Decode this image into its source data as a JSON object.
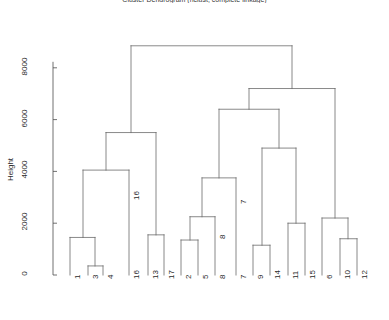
{
  "chart_data": {
    "type": "dendrogram",
    "title": "Cluster Dendrogram (hclust, complete linkage)",
    "xlabel": "",
    "ylabel": "Height",
    "ylim": [
      0,
      9200
    ],
    "yticks": [
      0,
      2000,
      4000,
      6000,
      8000
    ],
    "ytick_labels": [
      "0",
      "2000",
      "4000",
      "6000",
      "8000"
    ],
    "grid": false,
    "legend": null,
    "leaf_order": [
      "1",
      "3",
      "4",
      "16",
      "13",
      "17",
      "2",
      "5",
      "8",
      "7",
      "9",
      "14",
      "11",
      "15",
      "6",
      "10",
      "12"
    ],
    "leaves": [
      {
        "label": "1",
        "x": 70,
        "height": 0
      },
      {
        "label": "3",
        "x": 88,
        "height": 0
      },
      {
        "label": "4",
        "x": 103,
        "height": 0
      },
      {
        "label": "16",
        "x": 129,
        "height": 0
      },
      {
        "label": "13",
        "x": 148,
        "height": 0
      },
      {
        "label": "17",
        "x": 164,
        "height": 0
      },
      {
        "label": "2",
        "x": 181,
        "height": 0
      },
      {
        "label": "5",
        "x": 198,
        "height": 0
      },
      {
        "label": "8",
        "x": 215,
        "height": 0
      },
      {
        "label": "7",
        "x": 236,
        "height": 0
      },
      {
        "label": "9",
        "x": 253,
        "height": 0
      },
      {
        "label": "14",
        "x": 270,
        "height": 0
      },
      {
        "label": "11",
        "x": 288,
        "height": 0
      },
      {
        "label": "15",
        "x": 305,
        "height": 0
      },
      {
        "label": "6",
        "x": 322,
        "height": 0
      },
      {
        "label": "10",
        "x": 340,
        "height": 0
      },
      {
        "label": "12",
        "x": 357,
        "height": 0
      }
    ],
    "merges": [
      {
        "id": "m1",
        "label": "3-4",
        "left": 88,
        "right": 103,
        "height": 350
      },
      {
        "id": "m2",
        "label": "1-(3,4)",
        "left": 70,
        "right": 95,
        "height": 1450
      },
      {
        "id": "m3",
        "label": "13-17",
        "left": 148,
        "right": 164,
        "height": 1550
      },
      {
        "id": "m4",
        "label": "1,3,4 + 16",
        "left": 83,
        "right": 129,
        "height": 4050
      },
      {
        "id": "m5",
        "label": "left-top",
        "left": 106,
        "right": 156,
        "height": 5500
      },
      {
        "id": "m6",
        "label": "2-5",
        "left": 181,
        "right": 198,
        "height": 1350
      },
      {
        "id": "m7",
        "label": "(2,5)+8",
        "left": 190,
        "right": 215,
        "height": 2250
      },
      {
        "id": "m8",
        "label": "(2,5,8)+7",
        "left": 202,
        "right": 236,
        "height": 3750
      },
      {
        "id": "m9",
        "label": "9-14",
        "left": 253,
        "right": 270,
        "height": 1150
      },
      {
        "id": "m10",
        "label": "11-15",
        "left": 288,
        "right": 305,
        "height": 2000
      },
      {
        "id": "m11",
        "label": "(9,14)+(11,15)",
        "left": 262,
        "right": 296,
        "height": 4900
      },
      {
        "id": "m12",
        "label": "10-12",
        "left": 340,
        "right": 357,
        "height": 1400
      },
      {
        "id": "m13",
        "label": "6+(10,12)",
        "left": 322,
        "right": 348,
        "height": 2200
      },
      {
        "id": "m14",
        "label": "right-mid",
        "left": 219,
        "right": 279,
        "height": 6400
      },
      {
        "id": "m15",
        "label": "right-top",
        "left": 249,
        "right": 335,
        "height": 7200
      },
      {
        "id": "m16",
        "label": "root",
        "left": 131,
        "right": 292,
        "height": 8850
      }
    ],
    "internal_labels": [
      {
        "label": "16",
        "x": 129,
        "y_height": 3050
      },
      {
        "label": "8",
        "x": 215,
        "y_height": 1550
      },
      {
        "label": "7",
        "x": 236,
        "y_height": 2900
      }
    ],
    "axis": {
      "y_pixel_zero": 275,
      "y_pixel_per_unit": 0.0259,
      "tick_x": 57,
      "spine_x": 53,
      "spine_top": 62,
      "spine_bottom": 278
    }
  }
}
